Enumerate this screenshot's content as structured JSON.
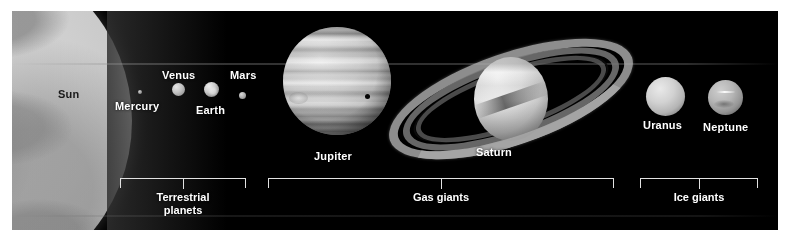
{
  "figure": {
    "background_color": "#ffffff",
    "plate_color": "#000000"
  },
  "bodies": [
    {
      "name": "Sun",
      "label": "Sun",
      "label_style": "dark",
      "kind": "star"
    },
    {
      "name": "Mercury",
      "label": "Mercury",
      "label_style": "light",
      "kind": "terrestrial"
    },
    {
      "name": "Venus",
      "label": "Venus",
      "label_style": "light",
      "kind": "terrestrial"
    },
    {
      "name": "Earth",
      "label": "Earth",
      "label_style": "light",
      "kind": "terrestrial"
    },
    {
      "name": "Mars",
      "label": "Mars",
      "label_style": "light",
      "kind": "terrestrial"
    },
    {
      "name": "Jupiter",
      "label": "Jupiter",
      "label_style": "light",
      "kind": "gas-giant"
    },
    {
      "name": "Saturn",
      "label": "Saturn",
      "label_style": "light",
      "kind": "gas-giant"
    },
    {
      "name": "Uranus",
      "label": "Uranus",
      "label_style": "light",
      "kind": "ice-giant"
    },
    {
      "name": "Neptune",
      "label": "Neptune",
      "label_style": "light",
      "kind": "ice-giant"
    }
  ],
  "labels": {
    "sun": "Sun",
    "mercury": "Mercury",
    "venus": "Venus",
    "earth": "Earth",
    "mars": "Mars",
    "jupiter": "Jupiter",
    "saturn": "Saturn",
    "uranus": "Uranus",
    "neptune": "Neptune"
  },
  "groups": [
    {
      "id": "terrestrial",
      "label": "Terrestrial\nplanets",
      "members": [
        "Mercury",
        "Venus",
        "Earth",
        "Mars"
      ]
    },
    {
      "id": "gas-giants",
      "label": "Gas giants",
      "members": [
        "Jupiter",
        "Saturn"
      ]
    },
    {
      "id": "ice-giants",
      "label": "Ice giants",
      "members": [
        "Uranus",
        "Neptune"
      ]
    }
  ],
  "group_labels": {
    "terrestrial": "Terrestrial\nplanets",
    "gas_giants": "Gas giants",
    "ice_giants": "Ice giants"
  },
  "colors": {
    "label_light": "#ffffff",
    "label_dark": "#1a1a1a",
    "bracket": "#e2e2e2",
    "sky": "#000000",
    "sun_surface": "#cfcfcf"
  }
}
